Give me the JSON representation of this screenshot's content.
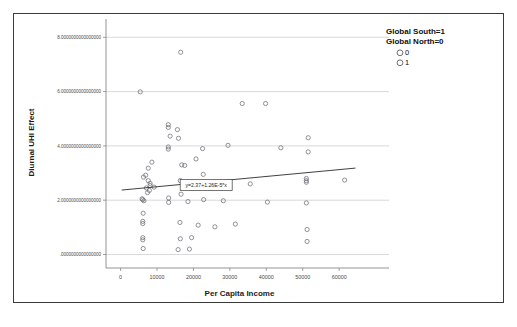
{
  "chart_data": {
    "type": "scatter",
    "title": "",
    "xlabel": "Per Capita Income",
    "ylabel": "Diurnal UHI Effect",
    "xlim": [
      -4000,
      66000
    ],
    "ylim": [
      -0.35,
      8.6
    ],
    "grid": true,
    "xticks": [
      0,
      10000,
      20000,
      30000,
      40000,
      50000,
      60000
    ],
    "xtick_labels": [
      "0",
      "10000",
      "20000",
      "30000",
      "40000",
      "50000",
      "60000"
    ],
    "yticks": [
      0,
      2,
      4,
      6,
      8
    ],
    "ytick_labels": [
      ".0000000000000000",
      "2.0000000000000000",
      "4.0000000000000000",
      "6.0000000000000000",
      "8.0000000000000000"
    ],
    "legend": {
      "title_line1": "Global South=1",
      "title_line2": "Global North=0",
      "position": "top-right",
      "entries": [
        {
          "label": "0",
          "marker": "open-circle"
        },
        {
          "label": "1",
          "marker": "open-circle"
        }
      ]
    },
    "annotation": {
      "text": "y=2.37+1.26E-5*x",
      "x": 23500,
      "y": 2.56,
      "boxed": true
    },
    "fit_line": {
      "intercept": 2.37,
      "slope": 1.26e-05,
      "x_start": 300,
      "x_end": 64500
    },
    "points": [
      {
        "x": 16500,
        "y": 7.45
      },
      {
        "x": 5400,
        "y": 5.99
      },
      {
        "x": 13100,
        "y": 4.78
      },
      {
        "x": 13100,
        "y": 4.68
      },
      {
        "x": 15600,
        "y": 4.6
      },
      {
        "x": 13600,
        "y": 4.36
      },
      {
        "x": 15900,
        "y": 4.28
      },
      {
        "x": 13100,
        "y": 3.96
      },
      {
        "x": 13100,
        "y": 3.88
      },
      {
        "x": 22500,
        "y": 3.9
      },
      {
        "x": 29500,
        "y": 4.02
      },
      {
        "x": 44000,
        "y": 3.93
      },
      {
        "x": 51500,
        "y": 4.3
      },
      {
        "x": 51500,
        "y": 3.78
      },
      {
        "x": 8600,
        "y": 3.4
      },
      {
        "x": 7600,
        "y": 3.18
      },
      {
        "x": 16800,
        "y": 3.3
      },
      {
        "x": 17600,
        "y": 3.28
      },
      {
        "x": 20700,
        "y": 3.52
      },
      {
        "x": 6900,
        "y": 2.92
      },
      {
        "x": 6300,
        "y": 2.85
      },
      {
        "x": 7600,
        "y": 2.72
      },
      {
        "x": 8100,
        "y": 2.62
      },
      {
        "x": 8100,
        "y": 2.54
      },
      {
        "x": 7900,
        "y": 2.36
      },
      {
        "x": 7400,
        "y": 2.28
      },
      {
        "x": 16400,
        "y": 2.72
      },
      {
        "x": 22700,
        "y": 2.95
      },
      {
        "x": 33400,
        "y": 5.56
      },
      {
        "x": 39800,
        "y": 5.56
      },
      {
        "x": 27400,
        "y": 2.56
      },
      {
        "x": 35600,
        "y": 2.6
      },
      {
        "x": 51000,
        "y": 2.8
      },
      {
        "x": 51000,
        "y": 2.72
      },
      {
        "x": 51000,
        "y": 2.66
      },
      {
        "x": 61500,
        "y": 2.74
      },
      {
        "x": 5900,
        "y": 2.05
      },
      {
        "x": 6100,
        "y": 2.02
      },
      {
        "x": 6400,
        "y": 1.98
      },
      {
        "x": 13200,
        "y": 2.08
      },
      {
        "x": 13200,
        "y": 1.92
      },
      {
        "x": 18500,
        "y": 1.95
      },
      {
        "x": 16600,
        "y": 2.22
      },
      {
        "x": 22800,
        "y": 2.02
      },
      {
        "x": 28200,
        "y": 1.98
      },
      {
        "x": 40300,
        "y": 1.93
      },
      {
        "x": 51000,
        "y": 1.9
      },
      {
        "x": 6200,
        "y": 1.52
      },
      {
        "x": 6100,
        "y": 1.22
      },
      {
        "x": 6100,
        "y": 1.14
      },
      {
        "x": 16300,
        "y": 1.18
      },
      {
        "x": 21300,
        "y": 1.08
      },
      {
        "x": 25900,
        "y": 1.02
      },
      {
        "x": 31500,
        "y": 1.12
      },
      {
        "x": 6100,
        "y": 0.62
      },
      {
        "x": 6100,
        "y": 0.54
      },
      {
        "x": 16400,
        "y": 0.58
      },
      {
        "x": 19500,
        "y": 0.62
      },
      {
        "x": 51200,
        "y": 0.92
      },
      {
        "x": 51200,
        "y": 0.48
      },
      {
        "x": 6200,
        "y": 0.22
      },
      {
        "x": 15800,
        "y": 0.18
      },
      {
        "x": 18900,
        "y": 0.2
      },
      {
        "x": 7100,
        "y": 2.45
      },
      {
        "x": 9200,
        "y": 2.48
      }
    ]
  }
}
